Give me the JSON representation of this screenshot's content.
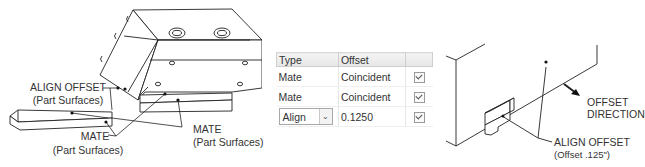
{
  "left_figure": {
    "labels": {
      "align_offset": "ALIGN OFFSET",
      "align_offset_sub": "(Part Surfaces)",
      "mate_left": "MATE",
      "mate_left_sub": "(Part Surfaces)",
      "mate_right": "MATE",
      "mate_right_sub": "(Part Surfaces)"
    }
  },
  "constraint_table": {
    "headers": {
      "type": "Type",
      "offset": "Offset",
      "flag": ""
    },
    "rows": [
      {
        "type": "Mate",
        "offset": "Coincident",
        "checked": true,
        "editable": false
      },
      {
        "type": "Mate",
        "offset": "Coincident",
        "checked": true,
        "editable": false
      },
      {
        "type": "Align",
        "offset": "0.1250",
        "checked": true,
        "editable": true
      }
    ]
  },
  "right_figure": {
    "labels": {
      "offset_direction_1": "OFFSET",
      "offset_direction_2": "DIRECTION",
      "align_offset": "ALIGN OFFSET",
      "align_offset_sub": "(Offset .125\")"
    }
  }
}
